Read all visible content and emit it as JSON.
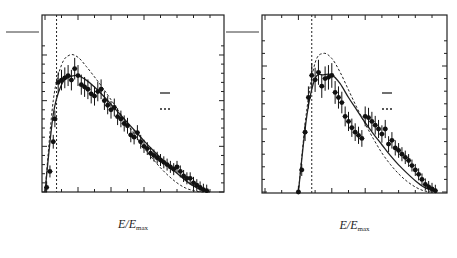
{
  "chart_data": [
    {
      "type": "scatter",
      "panel_label": "(a)",
      "title": "ARGUS",
      "process_label": "τ→ eνν̄",
      "ylabel_numerator": "N",
      "ylabel_denominator": "0.025",
      "xlabel": "E/E_max",
      "xlim": [
        0.0,
        1.05
      ],
      "ylim": [
        0,
        330
      ],
      "x_ticks": [
        "0.0",
        "0.2",
        "0.4",
        "0.6",
        "0.8",
        "1.0"
      ],
      "y_ticks": [
        "0",
        "100",
        "200",
        "300"
      ],
      "cut_line_x": 0.07,
      "legend": [
        {
          "name": "V − A",
          "style": "solid"
        },
        {
          "name": "V + A",
          "style": "dashed"
        }
      ],
      "series": [
        {
          "name": "data",
          "x": [
            0.01,
            0.03,
            0.05,
            0.06,
            0.08,
            0.1,
            0.12,
            0.14,
            0.16,
            0.18,
            0.2,
            0.22,
            0.24,
            0.26,
            0.28,
            0.3,
            0.32,
            0.34,
            0.36,
            0.38,
            0.4,
            0.42,
            0.44,
            0.46,
            0.48,
            0.5,
            0.52,
            0.54,
            0.56,
            0.58,
            0.6,
            0.62,
            0.64,
            0.66,
            0.68,
            0.7,
            0.72,
            0.74,
            0.76,
            0.78,
            0.8,
            0.82,
            0.84,
            0.86,
            0.88,
            0.9,
            0.92,
            0.94,
            0.96,
            0.98
          ],
          "y": [
            10,
            45,
            110,
            160,
            240,
            245,
            250,
            255,
            245,
            270,
            255,
            235,
            230,
            225,
            215,
            210,
            220,
            225,
            200,
            190,
            180,
            185,
            165,
            160,
            150,
            145,
            125,
            120,
            130,
            110,
            100,
            95,
            85,
            80,
            75,
            70,
            65,
            60,
            55,
            50,
            55,
            45,
            35,
            30,
            30,
            20,
            15,
            10,
            5,
            3
          ]
        },
        {
          "name": "V − A",
          "x": [
            0.0,
            0.05,
            0.1,
            0.15,
            0.2,
            0.25,
            0.3,
            0.35,
            0.4,
            0.45,
            0.5,
            0.55,
            0.6,
            0.65,
            0.7,
            0.75,
            0.8,
            0.85,
            0.9,
            0.95,
            1.0
          ],
          "y": [
            0,
            170,
            235,
            252,
            255,
            245,
            230,
            212,
            192,
            172,
            152,
            132,
            112,
            93,
            75,
            57,
            41,
            26,
            13,
            4,
            0
          ]
        },
        {
          "name": "V + A",
          "x": [
            0.0,
            0.05,
            0.1,
            0.15,
            0.2,
            0.25,
            0.3,
            0.35,
            0.4,
            0.45,
            0.5,
            0.55,
            0.6,
            0.65,
            0.7,
            0.75,
            0.8,
            0.85,
            0.9,
            0.95,
            1.0
          ],
          "y": [
            0,
            200,
            278,
            300,
            295,
            275,
            252,
            228,
            202,
            175,
            148,
            122,
            97,
            74,
            53,
            35,
            20,
            9,
            3,
            0,
            0
          ]
        }
      ]
    },
    {
      "type": "scatter",
      "panel_label": "(b)",
      "title": "",
      "process_label": "τ→μνν̄",
      "ylabel_numerator": "N",
      "ylabel_denominator": "0.025",
      "xlabel": "E/E_max",
      "xlim": [
        0.0,
        1.05
      ],
      "ylim": [
        0,
        240
      ],
      "x_ticks": [
        "0.0",
        "0.2",
        "0.4",
        "0.6",
        "0.8",
        "1.0"
      ],
      "y_ticks": [
        "0",
        "100",
        "200"
      ],
      "cut_line_x": 0.28,
      "legend": [
        {
          "name": "V − A",
          "style": "solid"
        },
        {
          "name": "V + A",
          "style": "dashed"
        }
      ],
      "series": [
        {
          "name": "data",
          "x": [
            0.2,
            0.22,
            0.24,
            0.26,
            0.28,
            0.3,
            0.32,
            0.34,
            0.36,
            0.38,
            0.4,
            0.42,
            0.44,
            0.46,
            0.48,
            0.5,
            0.52,
            0.54,
            0.56,
            0.58,
            0.6,
            0.62,
            0.64,
            0.66,
            0.68,
            0.7,
            0.72,
            0.74,
            0.76,
            0.78,
            0.8,
            0.82,
            0.84,
            0.86,
            0.88,
            0.9,
            0.92,
            0.94,
            0.96,
            0.98,
            1.0,
            1.02
          ],
          "y": [
            0,
            35,
            95,
            150,
            185,
            178,
            190,
            168,
            180,
            182,
            185,
            158,
            150,
            142,
            120,
            112,
            102,
            95,
            90,
            85,
            120,
            118,
            112,
            106,
            100,
            92,
            100,
            76,
            82,
            70,
            66,
            60,
            55,
            50,
            42,
            35,
            28,
            20,
            12,
            8,
            5,
            2
          ]
        },
        {
          "name": "V − A",
          "x": [
            0.2,
            0.25,
            0.3,
            0.35,
            0.4,
            0.45,
            0.5,
            0.55,
            0.6,
            0.65,
            0.7,
            0.75,
            0.8,
            0.85,
            0.9,
            0.95,
            1.0,
            1.03
          ],
          "y": [
            0,
            120,
            180,
            186,
            186,
            172,
            150,
            130,
            110,
            92,
            75,
            58,
            43,
            30,
            18,
            8,
            2,
            0
          ]
        },
        {
          "name": "V + A",
          "x": [
            0.2,
            0.25,
            0.3,
            0.35,
            0.4,
            0.45,
            0.5,
            0.55,
            0.6,
            0.65,
            0.7,
            0.75,
            0.8,
            0.85,
            0.9,
            0.95,
            1.0
          ],
          "y": [
            0,
            130,
            205,
            220,
            212,
            190,
            162,
            134,
            108,
            84,
            62,
            44,
            29,
            17,
            8,
            2,
            0
          ]
        }
      ]
    }
  ]
}
